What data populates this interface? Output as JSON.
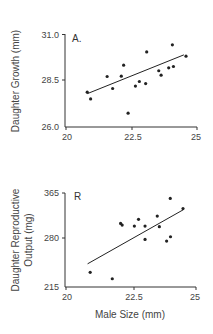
{
  "chart_data": [
    {
      "type": "scatter",
      "panel_label": "A.",
      "title": "",
      "xlabel": "",
      "ylabel": "Daughter Growth (mm)",
      "xlim": [
        20,
        25
      ],
      "ylim": [
        26.0,
        31.0
      ],
      "x_ticks": [
        "20",
        "22.5",
        "25"
      ],
      "y_ticks": [
        "26.0",
        "28.5",
        "31.0"
      ],
      "grid": false,
      "points": [
        [
          20.81,
          27.88
        ],
        [
          20.94,
          27.52
        ],
        [
          21.57,
          28.73
        ],
        [
          21.78,
          28.08
        ],
        [
          22.11,
          28.75
        ],
        [
          22.2,
          29.34
        ],
        [
          22.37,
          26.75
        ],
        [
          22.65,
          28.21
        ],
        [
          22.8,
          28.46
        ],
        [
          23.04,
          28.35
        ],
        [
          23.08,
          30.06
        ],
        [
          23.54,
          29.04
        ],
        [
          23.63,
          28.8
        ],
        [
          23.92,
          29.2
        ],
        [
          24.06,
          30.44
        ],
        [
          24.1,
          29.27
        ],
        [
          24.58,
          29.83
        ]
      ],
      "fit_line": [
        [
          20.81,
          27.8
        ],
        [
          24.5,
          29.9
        ]
      ]
    },
    {
      "type": "scatter",
      "panel_label": "R",
      "title": "",
      "xlabel": "Male Size (mm)",
      "ylabel": "Daughter Reproductive Output (mg)",
      "ylabel_lines": [
        "Daughter Reproductive",
        "Output (mg)"
      ],
      "xlim": [
        20,
        25
      ],
      "ylim": [
        215,
        365
      ],
      "x_ticks": [
        "20",
        "22.5",
        "25"
      ],
      "y_ticks": [
        "215",
        "280",
        "365"
      ],
      "grid": false,
      "points": [
        [
          20.93,
          238.4
        ],
        [
          21.78,
          228.2
        ],
        [
          22.1,
          316.4
        ],
        [
          22.16,
          313.8
        ],
        [
          22.63,
          312.2
        ],
        [
          22.79,
          323.0
        ],
        [
          23.04,
          312.2
        ],
        [
          23.04,
          290.9
        ],
        [
          23.51,
          328.2
        ],
        [
          23.59,
          311.3
        ],
        [
          23.87,
          288.3
        ],
        [
          24.01,
          356.4
        ],
        [
          24.02,
          295.2
        ],
        [
          24.5,
          340.1
        ]
      ],
      "fit_line": [
        [
          20.83,
          252
        ],
        [
          24.5,
          338
        ]
      ]
    }
  ],
  "labels": {
    "a_panel": "A.",
    "a_ylabel": "Daughter Growth (mm)",
    "a_y_top": "31.0",
    "a_y_mid": "28.5",
    "a_y_bot": "26.0",
    "a_x_left": "20",
    "a_x_mid": "22.5",
    "a_x_right": "25",
    "b_panel": "R",
    "b_ylabel_1": "Daughter Reproductive",
    "b_ylabel_2": "Output (mg)",
    "b_y_top": "365",
    "b_y_mid": "280",
    "b_y_bot": "215",
    "b_x_left": "20",
    "b_x_mid": "22.5",
    "b_x_right": "25",
    "xlabel": "Male Size (mm)"
  }
}
